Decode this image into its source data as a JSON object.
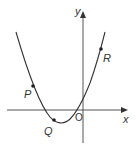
{
  "diagram": {
    "type": "parabola-graph",
    "axes": {
      "x_label": "x",
      "y_label": "y",
      "origin_label": "O"
    },
    "points": [
      {
        "label": "P",
        "position": "left branch, above x-axis"
      },
      {
        "label": "Q",
        "position": "near vertex, below x-axis"
      },
      {
        "label": "R",
        "position": "right branch, upper"
      }
    ],
    "colors": {
      "axis": "#444444",
      "curve": "#333333",
      "point": "#222222"
    }
  }
}
